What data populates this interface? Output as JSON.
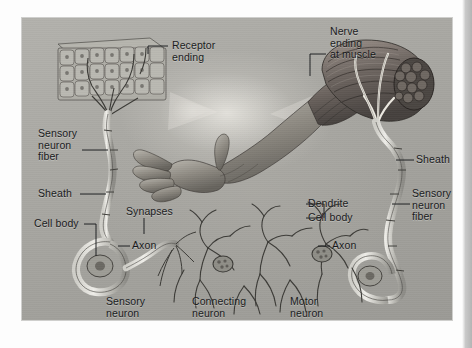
{
  "figure": {
    "background_color": "#a8a7a2",
    "label_color": "#17181a",
    "page_edge_color": "#b4b4b4"
  },
  "labels": {
    "receptor_ending": "Receptor\nending",
    "nerve_ending_at_muscle": "Nerve\nending\nat muscle",
    "sensory_neuron_fiber_left": "Sensory\nneuron\nfiber",
    "sheath_left": "Sheath",
    "cell_body_left": "Cell body",
    "axon_left": "Axon",
    "synapses": "Synapses",
    "dendrite": "Dendrite",
    "cell_body_right": "Cell body",
    "axon_right": "Axon",
    "sheath_right": "Sheath",
    "sensory_neuron_fiber_right": "Sensory\nneuron\nfiber",
    "sensory_neuron": "Sensory\nneuron",
    "connecting_neuron": "Connecting\nneuron",
    "motor_neuron": "Motor\nneuron"
  },
  "structures": {
    "epithelium": "receptor-tissue-block",
    "arm": "human-arm-and-hand",
    "muscle": "muscle-bundle-cutaway",
    "neuron_network": "interneuron-network"
  }
}
